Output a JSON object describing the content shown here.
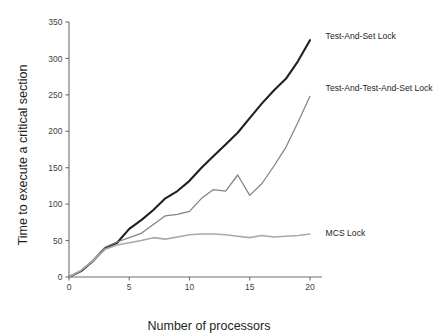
{
  "chart_data": {
    "type": "line",
    "title": "",
    "xlabel": "Number of processors",
    "ylabel": "Time to execute a critical section",
    "xlim": [
      0,
      21
    ],
    "ylim": [
      0,
      350
    ],
    "xticks": [
      0,
      5,
      10,
      15,
      20
    ],
    "xtick_labels": [
      "0",
      "5",
      "10",
      "15",
      "20"
    ],
    "yticks": [
      0,
      50,
      100,
      150,
      200,
      250,
      300,
      350
    ],
    "ytick_labels": [
      "0",
      "50",
      "100",
      "150",
      "200",
      "250",
      "300",
      "350"
    ],
    "grid": false,
    "legend_position": "right-of-line-ends",
    "x": [
      0,
      1,
      2,
      3,
      4,
      5,
      6,
      7,
      8,
      9,
      10,
      11,
      12,
      13,
      14,
      15,
      16,
      17,
      18,
      19,
      20
    ],
    "series": [
      {
        "name": "Test-And-Set Lock",
        "color": "#231f20",
        "width": 2.1,
        "label_x": 21.3,
        "label_y": 330,
        "values": [
          0,
          8,
          22,
          40,
          47,
          66,
          78,
          92,
          108,
          118,
          132,
          150,
          166,
          182,
          198,
          218,
          238,
          256,
          272,
          296,
          325
        ]
      },
      {
        "name": "Test-And-Test-And-Set Lock",
        "color": "#808285",
        "width": 1.25,
        "label_x": 21.3,
        "label_y": 258,
        "values": [
          0,
          9,
          23,
          41,
          48,
          54,
          60,
          72,
          84,
          86,
          90,
          108,
          120,
          118,
          140,
          112,
          128,
          152,
          178,
          212,
          248
        ]
      },
      {
        "name": "MCS Lock",
        "color": "#a7a9ac",
        "width": 1.6,
        "label_x": 21.3,
        "label_y": 59,
        "values": [
          0,
          9,
          22,
          38,
          44,
          47,
          50,
          54,
          52,
          55,
          58,
          59,
          59,
          58,
          56,
          54,
          57,
          55,
          56,
          57,
          59
        ]
      }
    ]
  }
}
